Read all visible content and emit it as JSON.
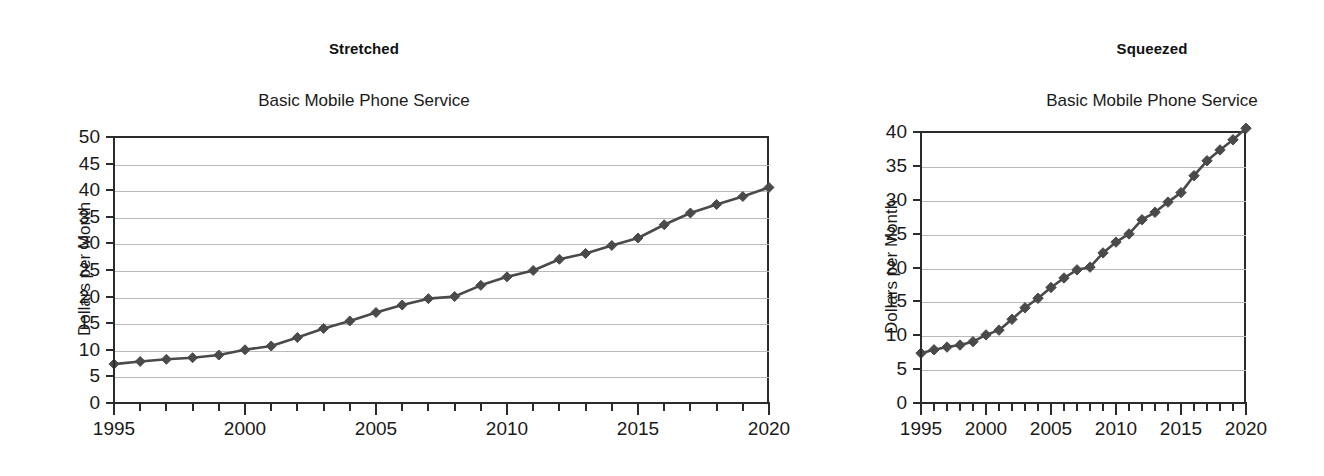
{
  "figure": {
    "background": "#ffffff",
    "series_color": "#4a4a4a",
    "axis_color": "#2b2b2b",
    "grid_color": "#b9b9b9"
  },
  "panels": [
    {
      "heading": "Stretched",
      "chart_title": "Basic Mobile Phone Service",
      "ylabel": "Dollars per Month"
    },
    {
      "heading": "Squeezed",
      "chart_title": "Basic Mobile Phone Service",
      "ylabel": "Dollars per Month"
    }
  ],
  "chart_data": [
    {
      "type": "line",
      "title": "Basic Mobile Phone Service",
      "panel_label": "Stretched",
      "xlabel": "",
      "ylabel": "Dollars per Month",
      "xlim": [
        1995,
        2020
      ],
      "ylim": [
        0,
        50
      ],
      "ytick_step": 5,
      "yticks": [
        0,
        5,
        10,
        15,
        20,
        25,
        30,
        35,
        40,
        45,
        50
      ],
      "ytick_labels": [
        "0",
        "5",
        "10",
        "15",
        "20",
        "25",
        "30",
        "35",
        "40",
        "45",
        "50"
      ],
      "xticks": [
        1995,
        1996,
        1997,
        1998,
        1999,
        2000,
        2001,
        2002,
        2003,
        2004,
        2005,
        2006,
        2007,
        2008,
        2009,
        2010,
        2011,
        2012,
        2013,
        2014,
        2015,
        2016,
        2017,
        2018,
        2019,
        2020
      ],
      "xtick_labels_shown": [
        "1995",
        "2000",
        "2005",
        "2010",
        "2015",
        "2020"
      ],
      "xtick_labels_shown_values": [
        1995,
        2000,
        2005,
        2010,
        2015,
        2020
      ],
      "grid": "horizontal",
      "legend": "none",
      "marker": "diamond",
      "x": [
        1995,
        1996,
        1997,
        1998,
        1999,
        2000,
        2001,
        2002,
        2003,
        2004,
        2005,
        2006,
        2007,
        2008,
        2009,
        2010,
        2011,
        2012,
        2013,
        2014,
        2015,
        2016,
        2017,
        2018,
        2019,
        2020
      ],
      "values": [
        7.5,
        8.0,
        8.4,
        8.7,
        9.2,
        10.2,
        10.9,
        12.5,
        14.2,
        15.6,
        17.2,
        18.6,
        19.8,
        20.2,
        22.3,
        23.9,
        25.1,
        27.2,
        28.3,
        29.8,
        31.2,
        33.7,
        35.9,
        37.5,
        39.0,
        40.7
      ]
    },
    {
      "type": "line",
      "title": "Basic Mobile Phone Service",
      "panel_label": "Squeezed",
      "xlabel": "",
      "ylabel": "Dollars per Month",
      "xlim": [
        1995,
        2020
      ],
      "ylim": [
        0,
        40
      ],
      "ytick_step": 5,
      "yticks": [
        0,
        5,
        10,
        15,
        20,
        25,
        30,
        35,
        40
      ],
      "ytick_labels": [
        "0",
        "5",
        "10",
        "15",
        "20",
        "25",
        "30",
        "35",
        "40"
      ],
      "xticks": [
        1995,
        1996,
        1997,
        1998,
        1999,
        2000,
        2001,
        2002,
        2003,
        2004,
        2005,
        2006,
        2007,
        2008,
        2009,
        2010,
        2011,
        2012,
        2013,
        2014,
        2015,
        2016,
        2017,
        2018,
        2019,
        2020
      ],
      "xtick_labels_shown": [
        "1995",
        "2000",
        "2005",
        "2010",
        "2015",
        "2020"
      ],
      "xtick_labels_shown_values": [
        1995,
        2000,
        2005,
        2010,
        2015,
        2020
      ],
      "grid": "horizontal",
      "legend": "none",
      "marker": "diamond",
      "x": [
        1995,
        1996,
        1997,
        1998,
        1999,
        2000,
        2001,
        2002,
        2003,
        2004,
        2005,
        2006,
        2007,
        2008,
        2009,
        2010,
        2011,
        2012,
        2013,
        2014,
        2015,
        2016,
        2017,
        2018,
        2019,
        2020
      ],
      "values": [
        7.5,
        8.0,
        8.4,
        8.7,
        9.2,
        10.2,
        10.9,
        12.5,
        14.2,
        15.6,
        17.2,
        18.6,
        19.8,
        20.2,
        22.3,
        23.9,
        25.1,
        27.2,
        28.3,
        29.8,
        31.2,
        33.7,
        35.9,
        37.5,
        39.0,
        40.7
      ]
    }
  ]
}
